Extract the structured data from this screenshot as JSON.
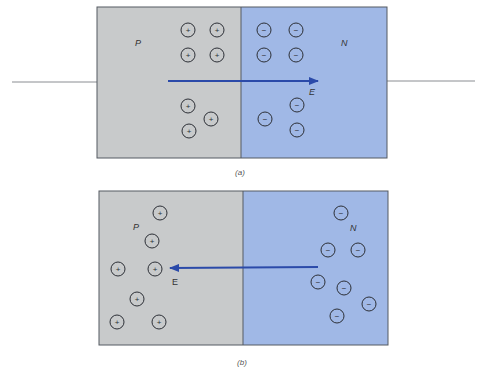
{
  "colors": {
    "p_region": "#c8cacb",
    "n_region": "#a0b8e6",
    "border": "#555a62",
    "arrow": "#2b4aa9",
    "charge_stroke": "#2c2f36",
    "wire": "#8a8d92"
  },
  "panel_a": {
    "p_label": "P",
    "n_label": "N",
    "field_label": "E",
    "caption": "(a)",
    "arrow_direction": "right",
    "positive_charges": [
      [
        188,
        30
      ],
      [
        217,
        30
      ],
      [
        188,
        55
      ],
      [
        217,
        55
      ],
      [
        188,
        106
      ],
      [
        211,
        119
      ],
      [
        189,
        131
      ]
    ],
    "negative_charges": [
      [
        264,
        30
      ],
      [
        296,
        30
      ],
      [
        264,
        55
      ],
      [
        296,
        55
      ],
      [
        297,
        105
      ],
      [
        265,
        119
      ],
      [
        297,
        130
      ]
    ]
  },
  "panel_b": {
    "p_label": "P",
    "n_label": "N",
    "field_label": "E",
    "caption": "(b)",
    "arrow_direction": "left",
    "positive_charges": [
      [
        160,
        213
      ],
      [
        152,
        241
      ],
      [
        118,
        269
      ],
      [
        155,
        269
      ],
      [
        137,
        299
      ],
      [
        117,
        322
      ],
      [
        159,
        322
      ]
    ],
    "negative_charges": [
      [
        341,
        213
      ],
      [
        328,
        250
      ],
      [
        358,
        250
      ],
      [
        318,
        282
      ],
      [
        344,
        288
      ],
      [
        369,
        304
      ],
      [
        337,
        316
      ]
    ]
  },
  "symbols": {
    "positive": "+",
    "negative": "−"
  }
}
